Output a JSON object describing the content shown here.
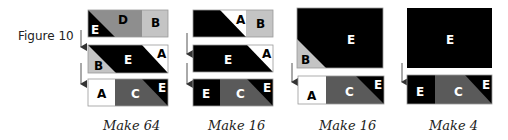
{
  "figure": {
    "title": "Figure 10",
    "colors": {
      "A": "#ffffff",
      "B": "#c4c4c4",
      "C": "#5a5a5a",
      "D": "#8e8e8e",
      "E": "#000000",
      "outline": "#9a9a9a",
      "arrow": "#555555"
    },
    "units": [
      {
        "make_label": "Make 64",
        "rows": [
          {
            "labels": [
              "E",
              "D",
              "B"
            ]
          },
          {
            "labels": [
              "B",
              "E",
              "A"
            ]
          },
          {
            "labels": [
              "A",
              "C",
              "E"
            ]
          }
        ]
      },
      {
        "make_label": "Make 16",
        "rows": [
          {
            "labels": [
              "A",
              "B"
            ]
          },
          {
            "labels": [
              "E",
              "A"
            ]
          },
          {
            "labels": [
              "E",
              "C",
              "E"
            ]
          }
        ]
      },
      {
        "make_label": "Make 16",
        "rows": [
          {
            "labels": [
              "E",
              "B"
            ]
          },
          {
            "labels": [
              "A",
              "C",
              "E"
            ]
          }
        ]
      },
      {
        "make_label": "Make 4",
        "rows": [
          {
            "labels": [
              "E"
            ]
          },
          {
            "labels": [
              "E",
              "C",
              "E"
            ]
          }
        ]
      }
    ]
  }
}
